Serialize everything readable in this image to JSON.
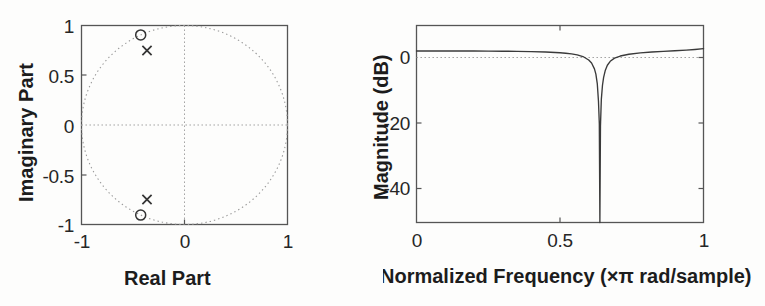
{
  "figure": {
    "background": "#fdfdfc",
    "line_color": "#3a3a3a",
    "grid_color": "#9a9a9a",
    "text_color": "#1c1c1c"
  },
  "panels": [
    {
      "id": "pole-zero-plot",
      "xlabel": "Real Part",
      "ylabel": "Imaginary Part",
      "xticks": [
        "-1",
        "0",
        "1"
      ],
      "yticks": [
        "1",
        "0.5",
        "0",
        "-0.5",
        "-1"
      ]
    },
    {
      "id": "magnitude-response-plot",
      "xlabel": "Normalized Frequency (×π rad/sample)",
      "ylabel": "Magnitude (dB)",
      "xticks": [
        "0",
        "0.5",
        "1"
      ],
      "yticks": [
        "0",
        "-20",
        "-40"
      ]
    }
  ],
  "chart_data": [
    {
      "type": "scatter",
      "title": "Pole-Zero Plot",
      "xlabel": "Real Part",
      "ylabel": "Imaginary Part",
      "xlim": [
        -1,
        1
      ],
      "ylim": [
        -1,
        1
      ],
      "xticks": [
        -1,
        0,
        1
      ],
      "xticklabels": [
        "-1",
        "0",
        "1"
      ],
      "yticks": [
        1,
        0.5,
        0,
        -0.5,
        -1
      ],
      "yticklabels": [
        "1",
        "0.5",
        "0",
        "-0.5",
        "-1"
      ],
      "grid": true,
      "legend": "none",
      "annotations": [
        "dotted unit circle radius 1 centered at origin"
      ],
      "series": [
        {
          "name": "zeros",
          "marker": "o",
          "points": [
            {
              "x": -0.425,
              "y": 0.905
            },
            {
              "x": -0.425,
              "y": -0.905
            }
          ]
        },
        {
          "name": "poles",
          "marker": "x",
          "points": [
            {
              "x": -0.37,
              "y": 0.755
            },
            {
              "x": -0.37,
              "y": -0.755
            }
          ]
        },
        {
          "name": "unit-circle",
          "marker": "dotted-circle",
          "center": {
            "x": 0,
            "y": 0
          },
          "radius": 1
        }
      ]
    },
    {
      "type": "line",
      "title": "Magnitude Response",
      "xlabel": "Normalized Frequency (×π rad/sample)",
      "ylabel": "Magnitude (dB)",
      "xlim": [
        0,
        1
      ],
      "ylim": [
        -52,
        8
      ],
      "xticks": [
        0,
        0.5,
        1
      ],
      "xticklabels": [
        "0",
        "0.5",
        "1"
      ],
      "yticks": [
        0,
        -20,
        -40
      ],
      "yticklabels": [
        "0",
        "-20",
        "-40"
      ],
      "grid": true,
      "legend": "none",
      "notch_frequency": 0.639,
      "x": [
        0,
        0.05,
        0.1,
        0.15,
        0.2,
        0.25,
        0.3,
        0.35,
        0.4,
        0.45,
        0.5,
        0.52,
        0.54,
        0.56,
        0.58,
        0.6,
        0.61,
        0.62,
        0.625,
        0.63,
        0.634,
        0.637,
        0.639,
        0.641,
        0.644,
        0.648,
        0.652,
        0.658,
        0.665,
        0.675,
        0.69,
        0.71,
        0.74,
        0.78,
        0.82,
        0.86,
        0.9,
        0.94,
        0.97,
        1.0
      ],
      "y": [
        0.25,
        0.25,
        0.24,
        0.23,
        0.22,
        0.2,
        0.17,
        0.12,
        0.05,
        -0.08,
        -0.3,
        -0.45,
        -0.65,
        -0.95,
        -1.45,
        -2.5,
        -3.4,
        -5.2,
        -6.8,
        -9.8,
        -15.0,
        -22.0,
        -52.0,
        -22.5,
        -14.5,
        -10.2,
        -7.8,
        -5.6,
        -4.1,
        -2.9,
        -1.95,
        -1.3,
        -0.75,
        -0.35,
        -0.08,
        0.12,
        0.3,
        0.5,
        0.7,
        0.95
      ]
    }
  ]
}
